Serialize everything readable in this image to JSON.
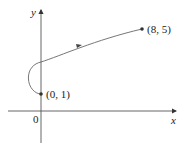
{
  "diagram": {
    "type": "parametric-curve",
    "axes": {
      "x_label": "x",
      "y_label": "y",
      "origin_label": "0"
    },
    "points": [
      {
        "label": "(0, 1)",
        "x": 0,
        "y": 1,
        "role": "start"
      },
      {
        "label": "(8, 5)",
        "x": 8,
        "y": 5,
        "role": "end"
      }
    ],
    "curve": {
      "description": "x = t^2 - 2t, y = t + 1, 0 <= t <= 4",
      "direction": "from (0,1) to (8,5)",
      "color": "#555555"
    },
    "colors": {
      "axis": "#333333",
      "curve": "#555555",
      "point": "#333333"
    }
  }
}
